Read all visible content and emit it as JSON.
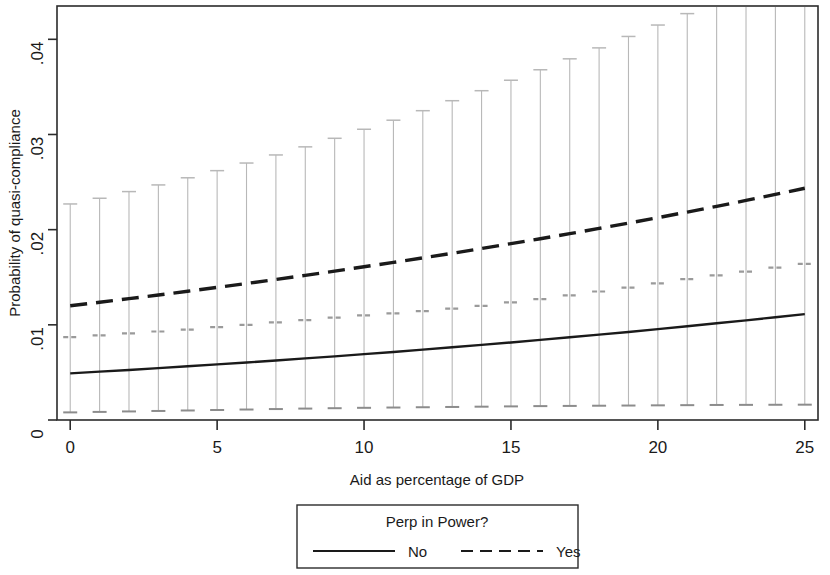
{
  "chart_data": {
    "type": "line",
    "title": "",
    "xlabel": "Aid as percentage of GDP",
    "ylabel": "Probability of quasi-compliance",
    "xlim": [
      -0.45,
      25.45
    ],
    "ylim": [
      0,
      0.0435
    ],
    "xticks": [
      0,
      5,
      10,
      15,
      20,
      25
    ],
    "xticklabels": [
      "0",
      "5",
      "10",
      "15",
      "20",
      "25"
    ],
    "yticks": [
      0,
      0.01,
      0.02,
      0.03,
      0.04
    ],
    "yticklabels": [
      "0",
      ".01",
      ".02",
      ".03",
      ".04"
    ],
    "grid": false,
    "legend": {
      "title": "Perp in Power?",
      "position": "below-plot",
      "entries": [
        {
          "label": "No",
          "style": "solid"
        },
        {
          "label": "Yes",
          "style": "dashed"
        }
      ]
    },
    "x": [
      0,
      1,
      2,
      3,
      4,
      5,
      6,
      7,
      8,
      9,
      10,
      11,
      12,
      13,
      14,
      15,
      16,
      17,
      18,
      19,
      20,
      21,
      22,
      23,
      24,
      25
    ],
    "series": [
      {
        "name": "No",
        "style": "solid",
        "color": "#1a1a1a",
        "values": [
          0.0049,
          0.00508,
          0.00526,
          0.00545,
          0.00564,
          0.00584,
          0.00604,
          0.00625,
          0.00647,
          0.00669,
          0.00692,
          0.00715,
          0.00739,
          0.00764,
          0.00789,
          0.00815,
          0.00842,
          0.00869,
          0.00897,
          0.00925,
          0.00955,
          0.00985,
          0.01016,
          0.01047,
          0.0108,
          0.01113
        ]
      },
      {
        "name": "Yes",
        "style": "dashed",
        "color": "#1a1a1a",
        "values": [
          0.012,
          0.01237,
          0.01275,
          0.01313,
          0.01353,
          0.01393,
          0.01434,
          0.01477,
          0.0152,
          0.01564,
          0.0161,
          0.01656,
          0.01703,
          0.01752,
          0.01802,
          0.01853,
          0.01905,
          0.01958,
          0.02013,
          0.02069,
          0.02126,
          0.02185,
          0.02245,
          0.02307,
          0.0237,
          0.02435
        ]
      }
    ],
    "error_bars": {
      "note": "95% confidence interval whiskers with interior mean cap, drawn in light gray at each integer x",
      "color": "#b8b8b8",
      "upper": [
        0.0227,
        0.0233,
        0.024,
        0.0247,
        0.02545,
        0.0262,
        0.027,
        0.02785,
        0.0287,
        0.0296,
        0.03055,
        0.0315,
        0.0325,
        0.03355,
        0.0346,
        0.0357,
        0.0368,
        0.03795,
        0.0391,
        0.0403,
        0.0415,
        0.0427,
        0.044,
        0.0453,
        0.0466,
        0.0479
      ],
      "lower": [
        0.0008,
        0.00085,
        0.0009,
        0.00095,
        0.001,
        0.00105,
        0.0011,
        0.00115,
        0.0012,
        0.00124,
        0.00128,
        0.00131,
        0.00134,
        0.00137,
        0.0014,
        0.00143,
        0.00146,
        0.00148,
        0.0015,
        0.00152,
        0.00154,
        0.00156,
        0.00158,
        0.00159,
        0.0016,
        0.00161
      ],
      "mid": [
        0.0087,
        0.0089,
        0.0091,
        0.0093,
        0.0095,
        0.00975,
        0.01,
        0.01025,
        0.0105,
        0.01075,
        0.011,
        0.0112,
        0.01145,
        0.0117,
        0.012,
        0.01235,
        0.0127,
        0.0131,
        0.0135,
        0.0139,
        0.01435,
        0.0148,
        0.0152,
        0.0156,
        0.016,
        0.0164
      ]
    }
  }
}
